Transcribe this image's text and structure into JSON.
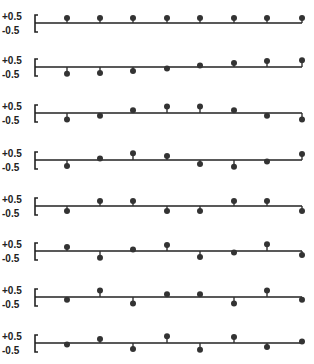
{
  "chart_data": {
    "type": "stem",
    "title": "",
    "xlabel": "",
    "ylabel": "",
    "y_tick_labels": [
      "+0.5",
      "-0.5"
    ],
    "ylim": [
      -0.5,
      0.5
    ],
    "grid": false,
    "n_points": 8,
    "series": [
      {
        "name": "row 1",
        "values": [
          0.35,
          0.35,
          0.35,
          0.35,
          0.35,
          0.35,
          0.35,
          0.35
        ]
      },
      {
        "name": "row 2",
        "values": [
          -0.49,
          -0.42,
          -0.28,
          -0.1,
          0.1,
          0.28,
          0.42,
          0.49
        ]
      },
      {
        "name": "row 3",
        "values": [
          -0.46,
          -0.19,
          0.19,
          0.46,
          0.46,
          0.19,
          -0.19,
          -0.46
        ]
      },
      {
        "name": "row 4",
        "values": [
          -0.42,
          0.1,
          0.49,
          0.28,
          -0.28,
          -0.49,
          -0.1,
          0.42
        ]
      },
      {
        "name": "row 5",
        "values": [
          -0.35,
          0.35,
          0.35,
          -0.35,
          -0.35,
          0.35,
          0.35,
          -0.35
        ]
      },
      {
        "name": "row 6",
        "values": [
          0.28,
          -0.49,
          0.1,
          0.42,
          -0.42,
          -0.1,
          0.49,
          -0.28
        ]
      },
      {
        "name": "row 7",
        "values": [
          -0.19,
          0.46,
          -0.46,
          0.19,
          0.19,
          -0.46,
          0.46,
          -0.19
        ]
      },
      {
        "name": "row 8",
        "values": [
          -0.1,
          0.28,
          -0.42,
          0.49,
          -0.49,
          0.42,
          -0.28,
          0.1
        ]
      }
    ]
  },
  "labels": {
    "top": "+0.5",
    "bottom": "-0.5"
  },
  "style": {
    "stem_color": "#333333",
    "axis_color": "#222222"
  }
}
